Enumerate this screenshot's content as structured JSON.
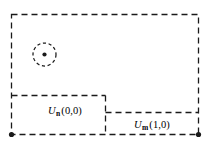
{
  "figure": {
    "kind": "domain-decomposition-diagram",
    "background_color": "#ffffff",
    "line_color": "#1a1a1a",
    "canvas": {
      "width": 209,
      "height": 155
    },
    "outer_region": {
      "name": "outer-dashed-rectangle",
      "x": 11,
      "y": 14,
      "width": 188,
      "height": 121,
      "stroke_style": "dashed"
    },
    "subregions": [
      {
        "name": "left-subregion",
        "label_symbol": "U",
        "label_subscript": "n",
        "label_coords": "(0,0)",
        "label_text": "U n (0,0)",
        "label_x": 65,
        "label_y": 112,
        "box": {
          "x": 11,
          "y": 95,
          "width": 94,
          "height": 40
        }
      },
      {
        "name": "right-subregion",
        "label_symbol": "U",
        "label_subscript": "m",
        "label_coords": "(1,0)",
        "label_text": "U m (1,0)",
        "label_x": 152,
        "label_y": 126,
        "box": {
          "x": 105,
          "y": 112,
          "width": 94,
          "height": 23
        }
      }
    ],
    "marker_circle": {
      "name": "dashed-circle-marker",
      "cx": 44.5,
      "cy": 54.5,
      "r": 11.5,
      "center_dot_r": 2.1,
      "stroke_style": "dashed"
    },
    "corner_points": [
      {
        "name": "bottom-left-node",
        "cx": 11.5,
        "cy": 134.5,
        "r": 2.6
      },
      {
        "name": "bottom-right-node",
        "cx": 198.5,
        "cy": 134.5,
        "r": 2.6
      }
    ],
    "dash_patterns": {
      "outer": "6 4",
      "inner": "6 4",
      "circle": "3.2 2.6"
    }
  }
}
